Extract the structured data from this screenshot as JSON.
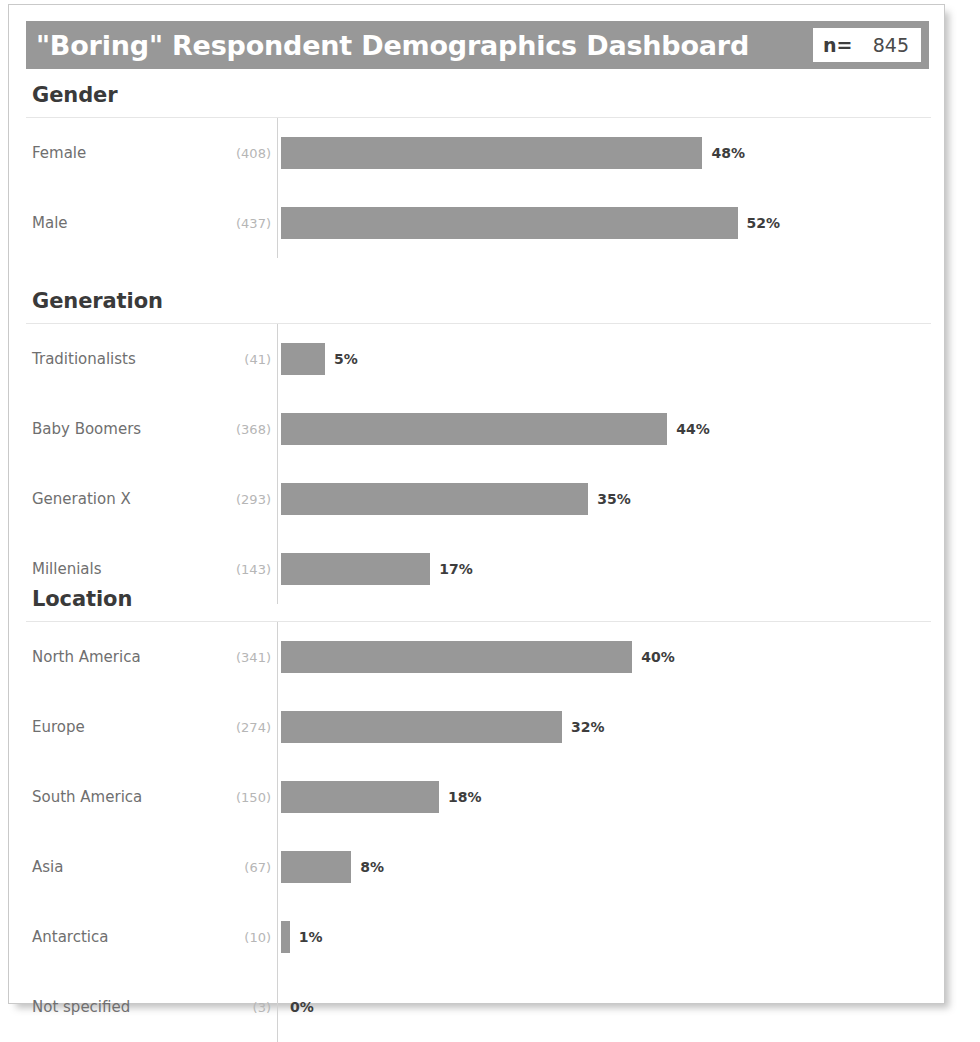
{
  "header": {
    "title": "\"Boring\" Respondent Demographics Dashboard",
    "n_label": "n=",
    "n_value": "845",
    "bar_color": "#989898",
    "title_color": "#ffffff"
  },
  "chart_data": {
    "type": "bar",
    "title": "\"Boring\" Respondent Demographics Dashboard",
    "orientation": "horizontal",
    "total_n": 845,
    "xlabel": "",
    "ylabel": "",
    "xlim": [
      0,
      100
    ],
    "grid": false,
    "legend": "none",
    "bar_color": "#989898",
    "axis_color": "#d2d2d2",
    "panels": [
      {
        "title": "Gender",
        "categories": [
          "Female",
          "Male"
        ],
        "counts": [
          408,
          437
        ],
        "values": [
          48,
          52
        ],
        "count_labels": [
          "(408)",
          "(437)"
        ],
        "value_labels": [
          "48%",
          "52%"
        ]
      },
      {
        "title": "Generation",
        "categories": [
          "Traditionalists",
          "Baby Boomers",
          "Generation X",
          "Millenials"
        ],
        "counts": [
          41,
          368,
          293,
          143
        ],
        "values": [
          5,
          44,
          35,
          17
        ],
        "count_labels": [
          "(41)",
          "(368)",
          "(293)",
          "(143)"
        ],
        "value_labels": [
          "5%",
          "44%",
          "35%",
          "17%"
        ]
      },
      {
        "title": "Location",
        "categories": [
          "North America",
          "Europe",
          "South America",
          "Asia",
          "Antarctica",
          "Not specified"
        ],
        "counts": [
          341,
          274,
          150,
          67,
          10,
          3
        ],
        "values": [
          40,
          32,
          18,
          8,
          1,
          0
        ],
        "count_labels": [
          "(341)",
          "(274)",
          "(150)",
          "(67)",
          "(10)",
          "(3)"
        ],
        "value_labels": [
          "40%",
          "32%",
          "18%",
          "8%",
          "1%",
          "0%"
        ]
      }
    ]
  }
}
